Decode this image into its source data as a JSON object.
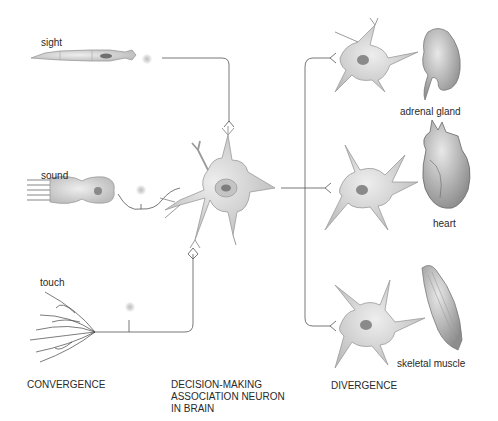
{
  "diagram": {
    "inputs": [
      {
        "label": "sight"
      },
      {
        "label": "sound"
      },
      {
        "label": "touch"
      }
    ],
    "center_neuron": {
      "caption_lines": [
        "DECISION-MAKING",
        "ASSOCIATION NEURON",
        "IN BRAIN"
      ]
    },
    "outputs": [
      {
        "label": "adrenal gland"
      },
      {
        "label": "heart"
      },
      {
        "label": "skeletal muscle"
      }
    ],
    "captions": {
      "left": "CONVERGENCE",
      "right": "DIVERGENCE"
    },
    "colors": {
      "line": "#555555",
      "cell_fill": "#d6d6d6",
      "cell_stroke": "#9a9a9a",
      "nucleus": "#8a8a8a",
      "background": "#ffffff"
    }
  }
}
